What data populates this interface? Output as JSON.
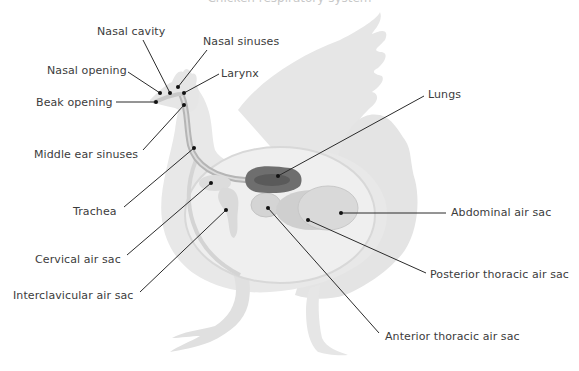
{
  "title": "Chicken respiratory system",
  "colors": {
    "silhouette": "#e4e4e4",
    "silhouette_dark": "#d6d6d6",
    "body_shell": "#ececec",
    "trachea": "#bdbdbd",
    "lungs": "#6e6e6e",
    "air_sac": "#d9d9d9",
    "leader_line": "#2b2b2b",
    "text": "#3c3c3c"
  },
  "labels": [
    {
      "id": "nasal-cavity",
      "text": "Nasal cavity",
      "x": 97,
      "y": 25
    },
    {
      "id": "nasal-sinuses",
      "text": "Nasal sinuses",
      "x": 203,
      "y": 35
    },
    {
      "id": "nasal-opening",
      "text": "Nasal opening",
      "x": 47,
      "y": 64
    },
    {
      "id": "larynx",
      "text": "Larynx",
      "x": 221,
      "y": 67
    },
    {
      "id": "beak-opening",
      "text": "Beak opening",
      "x": 36,
      "y": 96
    },
    {
      "id": "lungs",
      "text": "Lungs",
      "x": 428,
      "y": 88
    },
    {
      "id": "middle-ear-sinuses",
      "text": "Middle ear sinuses",
      "x": 34,
      "y": 148
    },
    {
      "id": "abdominal-air-sac",
      "text": "Abdominal air sac",
      "x": 451,
      "y": 206
    },
    {
      "id": "trachea",
      "text": "Trachea",
      "x": 73,
      "y": 205
    },
    {
      "id": "cervical-air-sac",
      "text": "Cervical air sac",
      "x": 35,
      "y": 253
    },
    {
      "id": "posterior-thoracic-air-sac",
      "text": "Posterior thoracic air sac",
      "x": 430,
      "y": 268
    },
    {
      "id": "interclavicular-air-sac",
      "text": "Interclavicular air sac",
      "x": 13,
      "y": 289
    },
    {
      "id": "anterior-thoracic-air-sac",
      "text": "Anterior thoracic air sac",
      "x": 385,
      "y": 330
    }
  ],
  "leaders": [
    {
      "id": "nasal-cavity",
      "x1": 143,
      "y1": 40,
      "x2": 170,
      "y2": 93
    },
    {
      "id": "nasal-sinuses",
      "x1": 207,
      "y1": 50,
      "x2": 178,
      "y2": 87
    },
    {
      "id": "nasal-opening",
      "x1": 128,
      "y1": 72,
      "x2": 160,
      "y2": 93
    },
    {
      "id": "larynx",
      "x1": 219,
      "y1": 74,
      "x2": 184,
      "y2": 93
    },
    {
      "id": "beak-opening",
      "x1": 116,
      "y1": 102,
      "x2": 156,
      "y2": 102
    },
    {
      "id": "middle-ear-sinuses",
      "x1": 143,
      "y1": 150,
      "x2": 184,
      "y2": 105
    },
    {
      "id": "trachea",
      "x1": 124,
      "y1": 207,
      "x2": 194,
      "y2": 148
    },
    {
      "id": "cervical-air-sac",
      "x1": 127,
      "y1": 255,
      "x2": 211,
      "y2": 183
    },
    {
      "id": "interclavicular-air-sac",
      "x1": 140,
      "y1": 292,
      "x2": 226,
      "y2": 210
    },
    {
      "id": "lungs",
      "x1": 424,
      "y1": 96,
      "x2": 278,
      "y2": 176
    },
    {
      "id": "abdominal-air-sac",
      "x1": 446,
      "y1": 213,
      "x2": 341,
      "y2": 213
    },
    {
      "id": "posterior-thoracic-air-sac",
      "x1": 426,
      "y1": 273,
      "x2": 308,
      "y2": 220
    },
    {
      "id": "anterior-thoracic-air-sac",
      "x1": 379,
      "y1": 333,
      "x2": 268,
      "y2": 208
    }
  ]
}
